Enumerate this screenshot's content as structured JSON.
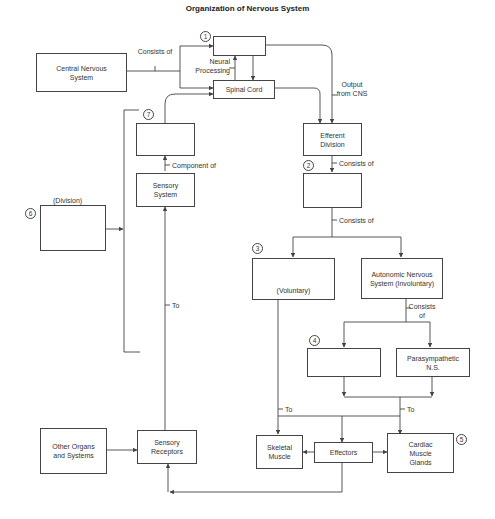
{
  "title": "Organization of Nervous System",
  "boxes": {
    "cns": "Central Nervous System",
    "box1": "",
    "spinal_cord": "Spinal Cord",
    "box7": "",
    "sensory_system": "Sensory System",
    "box6": "",
    "efferent": "Efferent Division",
    "box2": "",
    "box3": "(Voluntary)",
    "autonomic": "Autonomic Nervous System (Involuntary)",
    "box4": "",
    "parasympathetic": "Parasympathetic N.S.",
    "skeletal": "Skeletal Muscle",
    "effectors": "Effectors",
    "cardiac": "Cardiac Muscle Glands",
    "other_organs": "Other Organs and Systems",
    "sensory_receptors": "Sensory Receptors"
  },
  "labels": {
    "consists_of_top": "Consists of",
    "neural_processing": "Neural Processing",
    "output_from_cns": "Output from CNS",
    "component_of": "Component of",
    "division": "(Division)",
    "consists_of_2": "Consists of",
    "consists_of_3": "Consists of",
    "consists_of_ans": "Consists of",
    "to_sensory": "To",
    "to_skeletal": "To",
    "to_cardiac": "To"
  },
  "numbers": {
    "n1": "1",
    "n2": "2",
    "n3": "3",
    "n4": "4",
    "n5": "5",
    "n6": "6",
    "n7": "7"
  },
  "colors": {
    "line": "#444444",
    "text": "#333333",
    "background": "#ffffff"
  }
}
